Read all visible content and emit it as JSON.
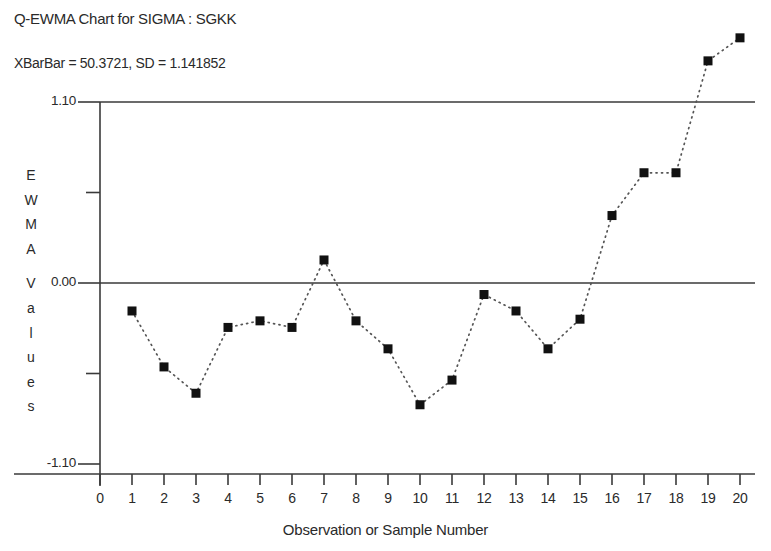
{
  "chart": {
    "title": "Q-EWMA Chart for SIGMA  : SGKK",
    "subtitle": "XBarBar = 50.3721, SD = 1.141852",
    "xlabel": "Observation or Sample Number",
    "ylabel_chars": [
      "E",
      "W",
      "M",
      "A",
      "",
      "V",
      "a",
      "l",
      "u",
      "e",
      "s"
    ],
    "ylabel_text": "EWMA Values",
    "marker_color": "#111111",
    "line_color": "#555555",
    "axis_color": "#3a3a3a"
  },
  "chart_data": {
    "type": "line",
    "title": "Q-EWMA Chart for SIGMA  : SGKK",
    "subtitle": "XBarBar = 50.3721, SD = 1.141852",
    "xlabel": "Observation or Sample Number",
    "ylabel": "EWMA Values",
    "x": [
      1,
      2,
      3,
      4,
      5,
      6,
      7,
      8,
      9,
      10,
      11,
      12,
      13,
      14,
      15,
      16,
      17,
      18,
      19,
      20
    ],
    "values": [
      -0.17,
      -0.51,
      -0.67,
      -0.27,
      -0.23,
      -0.27,
      0.14,
      -0.23,
      -0.4,
      -0.74,
      -0.59,
      -0.07,
      -0.17,
      -0.4,
      -0.22,
      0.41,
      0.67,
      0.67,
      1.35,
      1.49
    ],
    "xlim": [
      0,
      20
    ],
    "ylim": [
      -1.1,
      1.1
    ],
    "xticks": [
      0,
      1,
      2,
      3,
      4,
      5,
      6,
      7,
      8,
      9,
      10,
      11,
      12,
      13,
      14,
      15,
      16,
      17,
      18,
      19,
      20
    ],
    "xticklabels": [
      "0",
      "1",
      "2",
      "3",
      "4",
      "5",
      "6",
      "7",
      "8",
      "9",
      "10",
      "11",
      "12",
      "13",
      "14",
      "15",
      "16",
      "17",
      "18",
      "19",
      "20"
    ],
    "yticks": [
      -1.1,
      -0.55,
      0.0,
      0.55,
      1.1
    ],
    "yticklabels": [
      "-1.10",
      "",
      "0.00",
      "",
      "1.10"
    ],
    "control_limits": [
      {
        "name": "upper-control-limit",
        "value": 1.1
      },
      {
        "name": "center-line",
        "value": 0.0
      }
    ],
    "grid": false,
    "legend": null,
    "marker": "filled-square",
    "linestyle": "dotted"
  }
}
